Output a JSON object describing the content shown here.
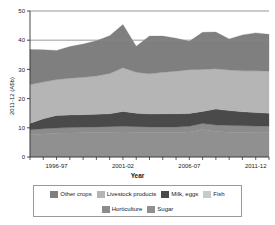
{
  "title": "",
  "axis": {
    "ylabel": "2011-12 (A$b)",
    "xlabel": "Year",
    "y_ticks": [
      "0",
      "10",
      "20",
      "30",
      "40",
      "50"
    ],
    "x_ticks": [
      "1996-97",
      "2001-02",
      "2006-07",
      "2011-12"
    ]
  },
  "legend": {
    "row1": [
      {
        "label": "Other crops",
        "color": "#7f7f7f"
      },
      {
        "label": "Livestock products",
        "color": "#b5b5b5"
      },
      {
        "label": "Milk, eggs",
        "color": "#4a4a4a"
      },
      {
        "label": "Fish",
        "color": "#c9c9c9"
      }
    ],
    "row2": [
      {
        "label": "Horticulture",
        "color": "#8c8c8c"
      },
      {
        "label": "Sugar",
        "color": "#909090"
      }
    ]
  },
  "chart_data": {
    "type": "area",
    "title": "",
    "xlabel": "Year",
    "ylabel": "2011-12 (A$b)",
    "ylim": [
      0,
      50
    ],
    "grid": true,
    "legend_position": "bottom",
    "stacked": true,
    "x": [
      "1994-95",
      "1995-96",
      "1996-97",
      "1997-98",
      "1998-99",
      "1999-00",
      "2000-01",
      "2001-02",
      "2002-03",
      "2003-04",
      "2004-05",
      "2005-06",
      "2006-07",
      "2007-08",
      "2008-09",
      "2009-10",
      "2010-11",
      "2011-12",
      "2012-13"
    ],
    "x_tick_labels": [
      "1996-97",
      "2001-02",
      "2006-07",
      "2011-12"
    ],
    "series": [
      {
        "name": "Sugar",
        "color": "#909090",
        "values": [
          7.6,
          7.9,
          8.1,
          8.2,
          8.3,
          8.4,
          8.5,
          8.6,
          8.5,
          8.4,
          8.4,
          8.4,
          8.6,
          9.4,
          8.7,
          8.5,
          8.4,
          8.3,
          8.3
        ]
      },
      {
        "name": "Horticulture",
        "color": "#8c8c8c",
        "values": [
          1.7,
          1.8,
          1.8,
          1.9,
          1.9,
          1.9,
          1.9,
          1.9,
          1.9,
          1.9,
          1.9,
          1.9,
          1.9,
          2.1,
          2.3,
          2.3,
          2.3,
          2.3,
          2.3
        ]
      },
      {
        "name": "Milk, eggs",
        "color": "#4a4a4a",
        "values": [
          2.2,
          3.4,
          4.3,
          4.3,
          4.3,
          4.3,
          4.4,
          5.1,
          4.6,
          4.4,
          4.5,
          4.5,
          4.4,
          4.1,
          5.4,
          5.1,
          4.8,
          4.6,
          4.4
        ]
      },
      {
        "name": "Livestock products",
        "color": "#b5b5b5",
        "values": [
          13.3,
          12.6,
          12.3,
          12.6,
          12.8,
          13.1,
          13.8,
          15.0,
          14.0,
          13.8,
          14.2,
          14.6,
          15.0,
          14.4,
          13.8,
          13.9,
          14.0,
          14.3,
          14.4
        ]
      },
      {
        "name": "Other crops",
        "color": "#7f7f7f",
        "values": [
          12.0,
          11.0,
          10.0,
          10.8,
          11.4,
          12.1,
          12.9,
          14.8,
          8.9,
          12.9,
          12.4,
          11.3,
          9.7,
          12.7,
          12.6,
          10.6,
          12.3,
          13.0,
          12.6
        ]
      }
    ],
    "series_order_bottom_to_top": [
      "Sugar",
      "Horticulture",
      "Milk, eggs",
      "Livestock products",
      "Other crops"
    ],
    "totals": [
      36.8,
      36.7,
      36.5,
      37.8,
      38.7,
      39.8,
      41.5,
      45.4,
      37.9,
      41.4,
      41.4,
      40.7,
      39.6,
      42.7,
      42.8,
      40.4,
      41.8,
      42.5,
      42.0
    ]
  }
}
